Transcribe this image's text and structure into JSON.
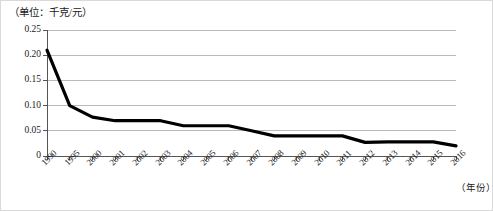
{
  "figure": {
    "unit_label": "（单位：千克/元）",
    "x_axis_title": "（年份）"
  },
  "chart_data": {
    "type": "line",
    "title": "",
    "subtitle": "",
    "unit_note": "（单位：千克/元）",
    "xlabel": "（年份）",
    "ylabel": "",
    "ylim": [
      0,
      0.25
    ],
    "y_ticks": [
      0,
      0.05,
      0.1,
      0.15,
      0.2,
      0.25
    ],
    "y_tick_labels": [
      "0",
      "0.05",
      "0.10",
      "0.15",
      "0.20",
      "0.25"
    ],
    "grid": "horizontal",
    "legend": "none",
    "line_color": "#000000",
    "gridline_color": "#aaaaaa",
    "categories": [
      "1990",
      "1995",
      "2000",
      "2001",
      "2002",
      "2003",
      "2004",
      "2005",
      "2006",
      "2007",
      "2008",
      "2009",
      "2010",
      "2011",
      "2012",
      "2013",
      "2014",
      "2015",
      "2016"
    ],
    "values": [
      0.21,
      0.1,
      0.077,
      0.07,
      0.07,
      0.07,
      0.06,
      0.06,
      0.06,
      0.05,
      0.04,
      0.04,
      0.04,
      0.04,
      0.027,
      0.028,
      0.028,
      0.028,
      0.02
    ],
    "series": [
      {
        "name": "",
        "values": [
          0.21,
          0.1,
          0.077,
          0.07,
          0.07,
          0.07,
          0.06,
          0.06,
          0.06,
          0.05,
          0.04,
          0.04,
          0.04,
          0.04,
          0.027,
          0.028,
          0.028,
          0.028,
          0.02
        ]
      }
    ]
  }
}
